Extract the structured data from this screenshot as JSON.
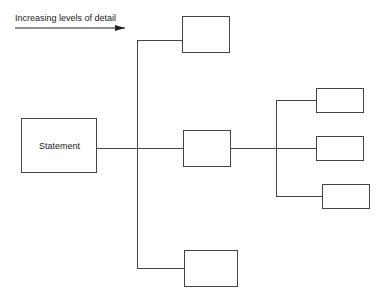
{
  "diagram": {
    "type": "tree",
    "arrow_label": "Increasing levels  of detail",
    "root": {
      "label": "Statement",
      "children": [
        {
          "label": ""
        },
        {
          "label": "",
          "children": [
            {
              "label": ""
            },
            {
              "label": ""
            },
            {
              "label": ""
            }
          ]
        },
        {
          "label": ""
        }
      ]
    }
  },
  "colors": {
    "line": "#444444",
    "text": "#222222",
    "background": "#ffffff"
  }
}
